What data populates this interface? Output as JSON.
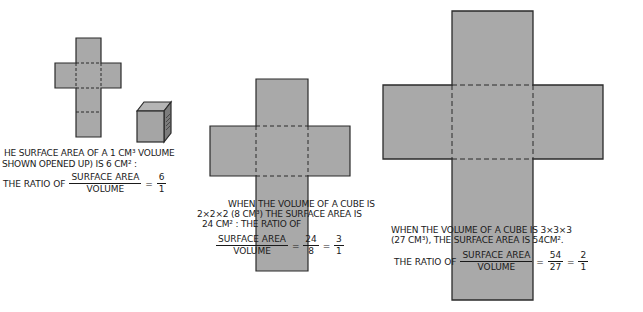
{
  "colors": {
    "face_fill": "#a9a9a9",
    "outline": "#2a2a2a",
    "background": "#ffffff",
    "cube_side": "#7c7c7c",
    "cube_top": "#b5b5b5"
  },
  "panels": [
    {
      "id": "cube-1",
      "side_length": 1,
      "caption_lines": [
        "HE SURFACE AREA OF A 1 CM³ VOLUME",
        "SHOWN OPENED UP) IS 6 CM² :"
      ],
      "ratio_prefix": "THE RATIO OF",
      "fraction_num": "SURFACE AREA",
      "fraction_den": "VOLUME",
      "equals": "=",
      "value_num": "6",
      "value_den": "1"
    },
    {
      "id": "cube-2",
      "side_length": 2,
      "caption_lines": [
        "WHEN THE VOLUME OF A CUBE IS",
        "2×2×2 (8 CM³) THE SURFACE AREA IS",
        "24 CM² : THE RATIO OF"
      ],
      "fraction_num": "SURFACE AREA",
      "fraction_den": "VOLUME",
      "equals": "=",
      "value_num": "24",
      "value_den": "8",
      "simplified_num": "3",
      "simplified_den": "1"
    },
    {
      "id": "cube-3",
      "side_length": 3,
      "caption_lines": [
        "WHEN THE VOLUME OF A CUBE IS 3×3×3",
        "(27 CM³), THE SURFACE AREA IS 54CM²."
      ],
      "ratio_prefix": "THE RATIO OF",
      "fraction_num": "SURFACE AREA",
      "fraction_den": "VOLUME",
      "equals": "=",
      "value_num": "54",
      "value_den": "27",
      "simplified_num": "2",
      "simplified_den": "1"
    }
  ]
}
